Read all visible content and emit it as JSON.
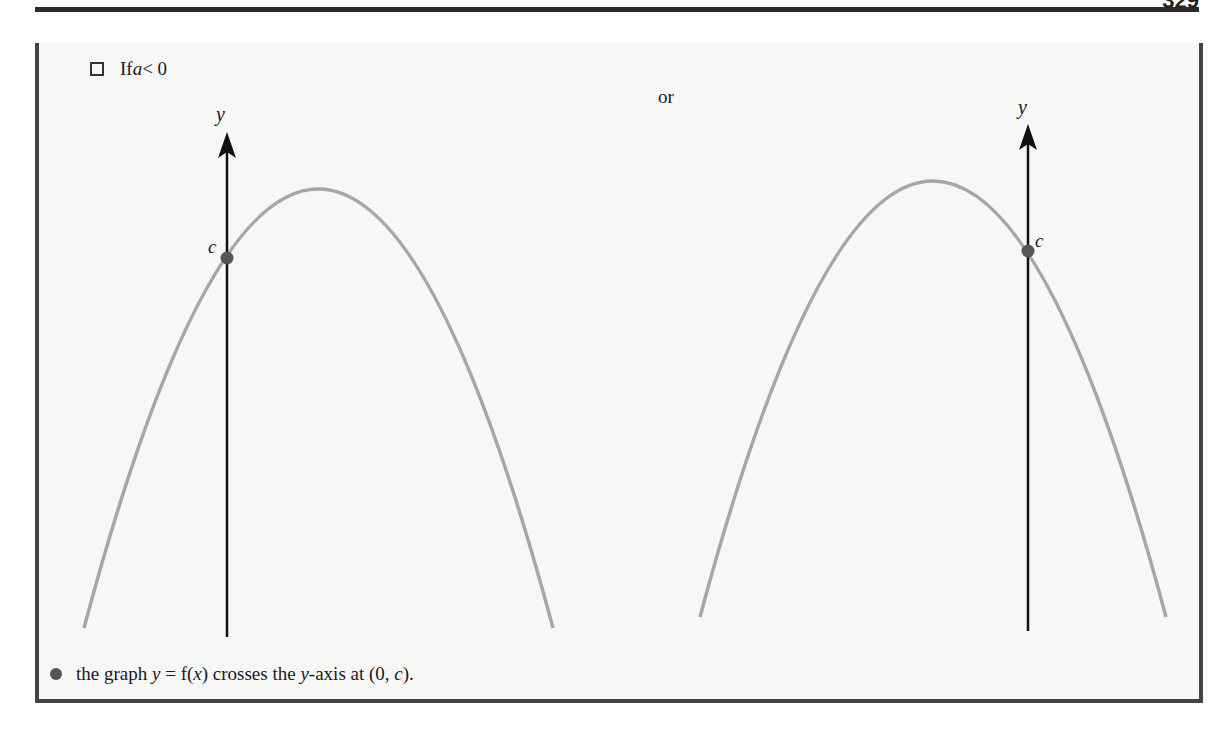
{
  "header": {
    "page_number": "329"
  },
  "box": {
    "case_label_prefix": "If ",
    "case_label_var": "a",
    "case_label_suffix": " < 0",
    "or_label": "or",
    "graphs": [
      {
        "axis_label": "y",
        "intercept_label": "c",
        "vertex": [
          318,
          189
        ],
        "intercept": [
          227,
          258
        ]
      },
      {
        "axis_label": "y",
        "intercept_label": "c",
        "vertex": [
          933,
          182
        ],
        "intercept": [
          1028,
          251
        ]
      }
    ],
    "bullet": {
      "t1": "the graph ",
      "t2": "y",
      "t3": " = f(",
      "t4": "x",
      "t5": ") crosses the ",
      "t6": "y",
      "t7": "-axis at (0, ",
      "t8": "c",
      "t9": ")."
    }
  },
  "colors": {
    "curve": "#a6a6a6",
    "axis": "#111111",
    "point": "#555555",
    "border": "#444444"
  }
}
